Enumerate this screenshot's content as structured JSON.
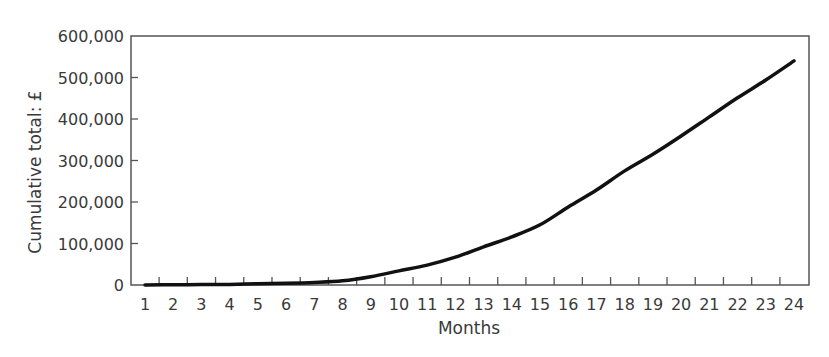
{
  "chart_data": {
    "type": "line",
    "title": "",
    "xlabel": "Months",
    "ylabel": "Cumulative total: £",
    "x": [
      1,
      2,
      3,
      4,
      5,
      6,
      7,
      8,
      9,
      10,
      11,
      12,
      13,
      14,
      15,
      16,
      17,
      18,
      19,
      20,
      21,
      22,
      23,
      24
    ],
    "categories": [
      "1",
      "2",
      "3",
      "4",
      "5",
      "6",
      "7",
      "8",
      "9",
      "10",
      "11",
      "12",
      "13",
      "14",
      "15",
      "16",
      "17",
      "18",
      "19",
      "20",
      "21",
      "22",
      "23",
      "24"
    ],
    "series": [
      {
        "name": "Cumulative total",
        "values": [
          0,
          500,
          1000,
          1500,
          3000,
          4000,
          6000,
          10000,
          20000,
          34000,
          48000,
          67000,
          92000,
          116000,
          145000,
          188000,
          229000,
          275000,
          315000,
          359000,
          405000,
          451000,
          494000,
          540000
        ],
        "color": "#111111"
      }
    ],
    "yticks": [
      0,
      100000,
      200000,
      300000,
      400000,
      500000,
      600000
    ],
    "ytick_labels": [
      "0",
      "100,000",
      "200,000",
      "300,000",
      "400,000",
      "500,000",
      "600,000"
    ],
    "ylim": [
      0,
      600000
    ],
    "xlim": [
      1,
      24
    ],
    "grid": false,
    "legend": null
  },
  "colors": {
    "axis": "#555555",
    "line": "#111111",
    "text": "#3a3a3a"
  }
}
